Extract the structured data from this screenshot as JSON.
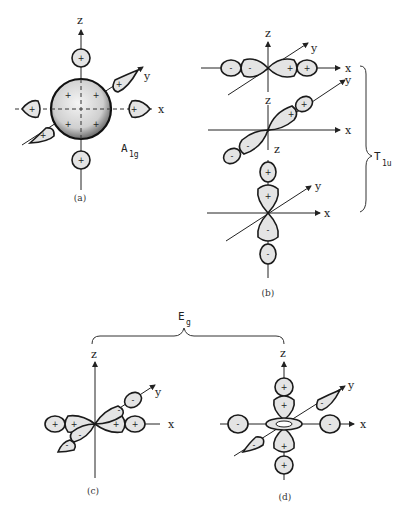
{
  "figure": {
    "panels": [
      {
        "id": "a",
        "caption": "(a)",
        "axes": {
          "x": "x",
          "y": "y",
          "z": "z"
        },
        "symmetry": "A",
        "symmetry_sub": "1g",
        "lobe_signs": [
          "+",
          "+",
          "+",
          "+",
          "+",
          "+"
        ],
        "center_signs": [
          "+",
          "+",
          "+",
          "+"
        ]
      },
      {
        "id": "b",
        "caption": "(b)",
        "rows": [
          {
            "axes": {
              "x": "x",
              "y": "y",
              "z": "z"
            },
            "signs": [
              "-",
              "-",
              "+",
              "+"
            ]
          },
          {
            "axes": {
              "x": "x",
              "y": "y",
              "z": "z"
            },
            "signs": [
              "-",
              "-",
              "+",
              "+"
            ]
          },
          {
            "axes": {
              "x": "x",
              "y": "y",
              "z": "z"
            },
            "signs": [
              "+",
              "+",
              "-",
              "-"
            ]
          }
        ]
      },
      {
        "id": "c",
        "caption": "(c)",
        "axes": {
          "x": "x",
          "y": "y",
          "z": "z"
        },
        "signs": [
          "+",
          "+",
          "+",
          "+",
          "-",
          "-",
          "-",
          "-"
        ]
      },
      {
        "id": "d",
        "caption": "(d)",
        "axes": {
          "x": "x",
          "y": "y",
          "z": "z"
        },
        "signs": [
          "+",
          "+",
          "+",
          "+",
          "-",
          "-",
          "-",
          "-"
        ]
      }
    ],
    "groups": {
      "t1u": {
        "label": "T",
        "sub": "1u"
      },
      "eg": {
        "label": "E",
        "sub": "g"
      }
    }
  }
}
